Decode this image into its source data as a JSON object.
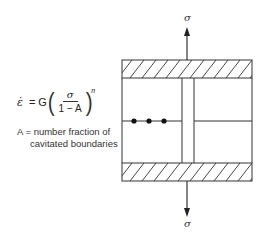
{
  "equation": {
    "lhs": "ε̇",
    "equals": "=",
    "coefficient": "G",
    "numerator": "σ",
    "denominator": "1 − A",
    "exponent": "n"
  },
  "definition": {
    "line1": "A = number fraction of",
    "line2": "cavitated boundaries"
  },
  "diagram": {
    "top_stress_label": "σ",
    "bottom_stress_label": "σ",
    "cavity_count": 3,
    "colors": {
      "line": "#333333",
      "background": "#ffffff"
    }
  }
}
